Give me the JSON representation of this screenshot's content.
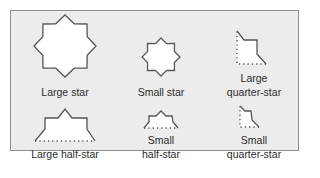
{
  "figure": {
    "colors": {
      "background": "#ececec",
      "border": "#8e8e8e",
      "shape_fill": "#ffffff",
      "shape_stroke": "#555555",
      "text": "#2b2b2b"
    },
    "items": [
      {
        "id": "large-star",
        "label_lines": [
          "Large star"
        ]
      },
      {
        "id": "small-star",
        "label_lines": [
          "Small star"
        ]
      },
      {
        "id": "large-quarter-star",
        "label_lines": [
          "Large",
          "quarter-star"
        ]
      },
      {
        "id": "large-half-star",
        "label_lines": [
          "Large half-star"
        ]
      },
      {
        "id": "small-half-star",
        "label_lines": [
          "Small",
          "half-star"
        ]
      },
      {
        "id": "small-quarter-star",
        "label_lines": [
          "Small",
          "quarter-star"
        ]
      }
    ]
  }
}
